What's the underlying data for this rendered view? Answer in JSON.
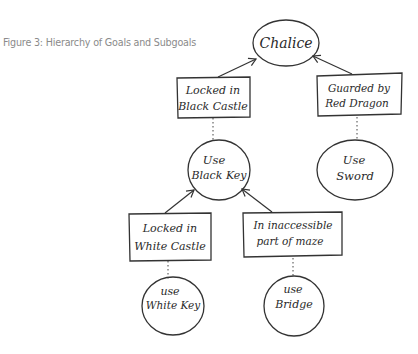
{
  "caption": "Figure 3: Hierarchy of Goals and Subgoals",
  "nodes": {
    "chalice": {
      "shape": "ellipse",
      "lines": [
        "Chalice"
      ]
    },
    "locked_black_castle": {
      "shape": "box",
      "lines": [
        "Locked in",
        "Black Castle"
      ]
    },
    "guarded_red_dragon": {
      "shape": "box",
      "lines": [
        "Guarded by",
        "Red Dragon"
      ]
    },
    "use_black_key": {
      "shape": "ellipse",
      "lines": [
        "Use",
        "Black Key"
      ]
    },
    "use_sword": {
      "shape": "ellipse",
      "lines": [
        "Use",
        "Sword"
      ]
    },
    "locked_white_castle": {
      "shape": "box",
      "lines": [
        "Locked in",
        "White Castle"
      ]
    },
    "inaccessible_maze": {
      "shape": "box",
      "lines": [
        "In inaccessible",
        "part of maze"
      ]
    },
    "use_white_key": {
      "shape": "ellipse",
      "lines": [
        "use",
        "White Key"
      ]
    },
    "use_bridge": {
      "shape": "ellipse",
      "lines": [
        "use",
        "Bridge"
      ]
    }
  },
  "edges": [
    {
      "from": "locked_black_castle",
      "to": "chalice",
      "style": "arrow"
    },
    {
      "from": "guarded_red_dragon",
      "to": "chalice",
      "style": "arrow"
    },
    {
      "from": "locked_black_castle",
      "to": "use_black_key",
      "style": "dotted"
    },
    {
      "from": "guarded_red_dragon",
      "to": "use_sword",
      "style": "dotted"
    },
    {
      "from": "locked_white_castle",
      "to": "use_black_key",
      "style": "arrow"
    },
    {
      "from": "inaccessible_maze",
      "to": "use_black_key",
      "style": "arrow"
    },
    {
      "from": "locked_white_castle",
      "to": "use_white_key",
      "style": "dotted"
    },
    {
      "from": "inaccessible_maze",
      "to": "use_bridge",
      "style": "dotted"
    }
  ]
}
